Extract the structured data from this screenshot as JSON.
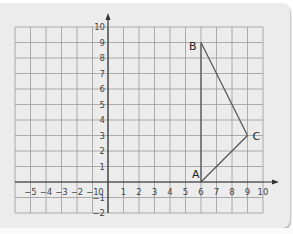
{
  "diagram": {
    "type": "coordinate-grid",
    "x_axis": {
      "min": -5,
      "max": 10,
      "tick_labels": [
        "-5",
        "-4",
        "-3",
        "-2",
        "-1",
        "0",
        "1",
        "2",
        "3",
        "4",
        "5",
        "6",
        "7",
        "8",
        "9",
        "10"
      ]
    },
    "y_axis": {
      "min": -2,
      "max": 10,
      "tick_labels": [
        "-2",
        "-1",
        "1",
        "2",
        "3",
        "4",
        "5",
        "6",
        "7",
        "8",
        "9",
        "10"
      ]
    },
    "points": [
      {
        "label": "A",
        "x": 6,
        "y": 0
      },
      {
        "label": "B",
        "x": 6,
        "y": 9
      },
      {
        "label": "C",
        "x": 9,
        "y": 3
      }
    ],
    "segments": [
      [
        "A",
        "B"
      ],
      [
        "B",
        "C"
      ],
      [
        "C",
        "A"
      ]
    ],
    "colors": {
      "background": "#ececec",
      "grid": "#9a9a9a",
      "axis": "#333333",
      "shape": "#555555"
    }
  }
}
